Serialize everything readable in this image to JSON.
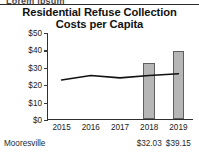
{
  "artifact": {
    "clipped_text_above": "Lorem ipsum"
  },
  "chart_data": {
    "type": "bar",
    "title": "Residential Refuse Collection Costs per Capita",
    "title_line1": "Residential Refuse Collection",
    "title_line2": "Costs per Capita",
    "xlabel": "",
    "ylabel": "",
    "categories": [
      "2015",
      "2016",
      "2017",
      "2018",
      "2019"
    ],
    "ylim": [
      0,
      50
    ],
    "ytick_values": [
      0,
      10,
      20,
      30,
      40,
      50
    ],
    "ytick_labels": [
      "$0",
      "$10",
      "$20",
      "$30",
      "$40",
      "$50"
    ],
    "grid": false,
    "legend": "none",
    "series": [
      {
        "name": "Mooresville",
        "type": "bar",
        "values": [
          null,
          null,
          null,
          32.03,
          39.15
        ],
        "color": "#b6b6b6",
        "edge_color": "#5f5f5f",
        "data_labels": [
          "",
          "",
          "",
          "$32.03",
          "$39.15"
        ]
      },
      {
        "name": "Benchmark average",
        "type": "line",
        "values": [
          23.0,
          25.6,
          24.2,
          25.6,
          26.6
        ],
        "color": "#111111"
      }
    ]
  },
  "footer": {
    "row_label": "Mooresville",
    "values": [
      {
        "year": "2018",
        "amount": "$32.03"
      },
      {
        "year": "2019",
        "amount": "$39.15"
      }
    ]
  }
}
